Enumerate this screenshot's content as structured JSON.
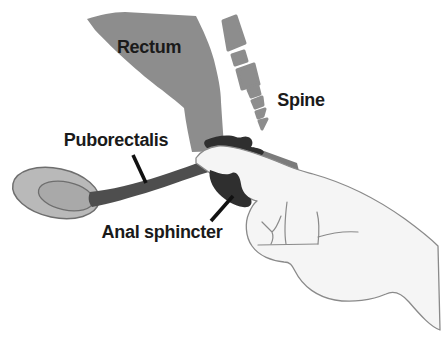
{
  "figure": {
    "background_color": "#ffffff",
    "labels": {
      "rectum": "Rectum",
      "spine": "Spine",
      "puborectalis": "Puborectalis",
      "anal_sphincter": "Anal sphincter"
    },
    "colors": {
      "organ_gray": "#8d8d8d",
      "canal_shadow_gray": "#7b7b7b",
      "bone_outer_gray": "#b9b9b9",
      "bone_inner_gray": "#a9a9a9",
      "muscle_dark_gray": "#4e4e4e",
      "sphincter_dark": "#2f2f2f",
      "hand_fill": "#f5f5f5",
      "hand_outline": "#8a8a8a",
      "label_text": "#1a1a1a",
      "leader_line": "#111111"
    },
    "parts": [
      {
        "name": "rectum-shape",
        "label": "Rectum"
      },
      {
        "name": "spine-vertebrae",
        "label": "Spine"
      },
      {
        "name": "puborectalis-muscle",
        "label": "Puborectalis"
      },
      {
        "name": "anal-sphincter-muscle",
        "label": "Anal sphincter"
      },
      {
        "name": "pubic-bone"
      },
      {
        "name": "examining-hand"
      }
    ]
  }
}
